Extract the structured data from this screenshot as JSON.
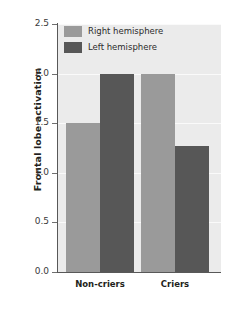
{
  "chart_data": {
    "type": "bar",
    "title": "",
    "xlabel": "",
    "ylabel": "Frontal lobe activation",
    "categories": [
      "Non-criers",
      "Criers"
    ],
    "series": [
      {
        "name": "Right hemisphere",
        "color": "#9a9a9a",
        "values": [
          1.5,
          2.0
        ]
      },
      {
        "name": "Left hemisphere",
        "color": "#575757",
        "values": [
          2.0,
          1.27
        ]
      }
    ],
    "ylim": [
      0.0,
      2.5
    ],
    "ytick_labels": [
      "0.0",
      "0.5",
      "1.0",
      "1.5",
      "2.0",
      "2.5"
    ],
    "ytick_values": [
      0.0,
      0.5,
      1.0,
      1.5,
      2.0,
      2.5
    ],
    "grid": true,
    "legend_position": "top-left-inside",
    "plot_background": "#ebebeb",
    "gridline_color": "#fafafa",
    "axis_color": "#585858"
  },
  "legend": {
    "entries": [
      {
        "label": "Right hemisphere",
        "swatch": "light"
      },
      {
        "label": "Left hemisphere",
        "swatch": "dark"
      }
    ]
  }
}
